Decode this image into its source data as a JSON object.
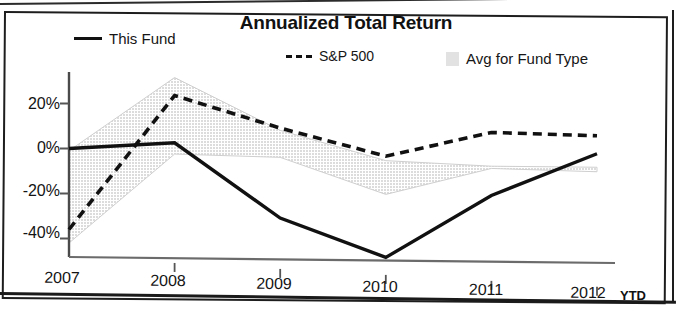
{
  "figure": {
    "title": "Annualized Total Return",
    "ytd_note": "YTD"
  },
  "legend": {
    "items": [
      {
        "label": "This Fund",
        "marker": "solid-line-swatch",
        "color": "#111111"
      },
      {
        "label": "S&P 500",
        "marker": "dashed-line-swatch",
        "color": "#111111"
      },
      {
        "label": "Avg for Fund Type",
        "marker": "filled-band-swatch",
        "color": "#e2e2e2"
      }
    ]
  },
  "axes": {
    "y_ticks": [
      "20%",
      "0%",
      "-20%",
      "-40%"
    ],
    "x_ticks": [
      "2007",
      "2008",
      "2009",
      "2010",
      "2011",
      "2012"
    ]
  },
  "chart_data": {
    "type": "line",
    "title": "Annualized Total Return",
    "xlabel": "",
    "ylabel": "",
    "categories": [
      "2007",
      "2008",
      "2009",
      "2010",
      "2011",
      "2012"
    ],
    "x_tick_labels": [
      "2007",
      "2008",
      "2009",
      "2010",
      "2011",
      "2012 YTD"
    ],
    "y_tick_labels": [
      "20%",
      "0%",
      "-20%",
      "-40%"
    ],
    "y_tick_values": [
      20,
      0,
      -20,
      -40
    ],
    "ylim": [
      -50,
      35
    ],
    "grid": false,
    "legend_position": "top",
    "series": [
      {
        "name": "This Fund",
        "style": "solid",
        "color": "#111111",
        "values": [
          0,
          3,
          -30,
          -47,
          -19,
          0
        ]
      },
      {
        "name": "S&P 500",
        "style": "dashed",
        "color": "#111111",
        "values": [
          -36,
          24,
          10,
          -2,
          9,
          8
        ]
      },
      {
        "name": "Avg for Fund Type",
        "style": "band",
        "color": "#e2e2e2",
        "band_upper": [
          -1,
          32,
          9,
          -4,
          -6,
          -6
        ],
        "band_lower": [
          -42,
          -2,
          -3,
          -19,
          -7,
          -8
        ]
      }
    ]
  }
}
